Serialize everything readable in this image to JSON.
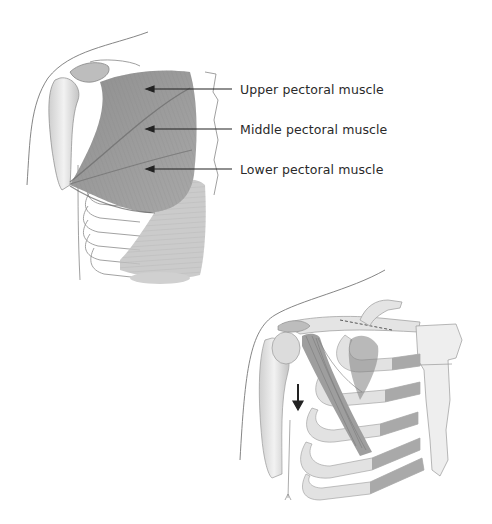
{
  "figure": {
    "top_panel": {
      "view": "anterior chest with pectoralis major",
      "labels": [
        {
          "id": "upper",
          "text": "Upper pectoral muscle",
          "x": 240,
          "y": 82,
          "arrow_y": 89,
          "arrow_from": 232,
          "arrow_to": 146
        },
        {
          "id": "middle",
          "text": "Middle pectoral muscle",
          "x": 240,
          "y": 122,
          "arrow_y": 129,
          "arrow_from": 232,
          "arrow_to": 146
        },
        {
          "id": "lower",
          "text": "Lower pectoral muscle",
          "x": 240,
          "y": 162,
          "arrow_y": 169,
          "arrow_from": 232,
          "arrow_to": 146
        }
      ]
    },
    "bottom_panel": {
      "view": "deep chest with pectoralis minor and rib cage",
      "annotation": "downward-arrow"
    },
    "colors": {
      "muscle": "#9a9a9a",
      "muscle_dark": "#7a7a7a",
      "bone": "#e6e6e6",
      "outline": "#666666",
      "text": "#2a2a2a",
      "arrow": "#222222"
    }
  }
}
